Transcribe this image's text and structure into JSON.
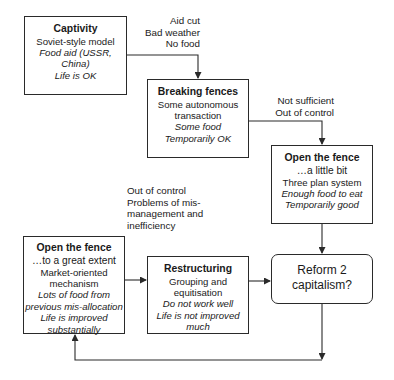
{
  "boxes": {
    "captivity": {
      "title": "Captivity",
      "lines": [
        "Soviet-style model"
      ],
      "italic_lines": [
        "Food aid (USSR,",
        "China)",
        "Life is OK"
      ]
    },
    "breaking_fences": {
      "title": "Breaking fences",
      "lines": [
        "Some autonomous",
        "transaction"
      ],
      "italic_lines": [
        "Some food",
        "Temporarily OK"
      ]
    },
    "open_little": {
      "title": "Open the fence",
      "subtitle": "…a little bit",
      "lines": [
        "Three plan system"
      ],
      "italic_lines": [
        "Enough food to eat",
        "Temporarily good"
      ]
    },
    "open_great": {
      "title": "Open the fence",
      "subtitle": "…to a great extent",
      "lines": [
        "Market-oriented",
        "mechanism"
      ],
      "italic_lines": [
        "Lots of food from",
        "previous mis-allocation",
        "Life is improved",
        "substantially"
      ]
    },
    "restructuring": {
      "title": "Restructuring",
      "lines": [
        "Grouping and",
        "equitisation"
      ],
      "italic_lines": [
        "Do not work well",
        "Life is not improved",
        "much"
      ]
    },
    "reform": {
      "lines": [
        "Reform 2",
        "capitalism?"
      ]
    }
  },
  "edge_labels": {
    "captivity_to_breaking": [
      "Aid cut",
      "Bad weather",
      "No food"
    ],
    "breaking_to_open_little": [
      "Not sufficient",
      "Out of control"
    ],
    "great_extent_note": [
      "Out of control",
      "Problems of mis-",
      "management and",
      "inefficiency"
    ]
  },
  "colors": {
    "line": "#2a2a2a",
    "background": "#ffffff",
    "text": "#1a1a1a"
  }
}
